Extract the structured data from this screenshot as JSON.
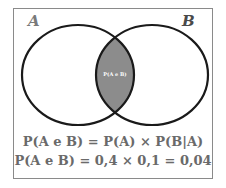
{
  "diagram": {
    "type": "venn",
    "sets": [
      {
        "id": "A",
        "label": "A"
      },
      {
        "id": "B",
        "label": "B"
      }
    ],
    "intersection": {
      "label": "P(A e B)",
      "fill_color": "#8c8c8c"
    },
    "formulas": [
      "P(A e B) = P(A) × P(B|A)",
      "P(A e B) = 0,4 × 0,1 = 0,04"
    ],
    "colors": {
      "circle_stroke": "#1a1a1a",
      "frame_border": "#8a8a8a",
      "text": "#6a6a6a"
    }
  }
}
